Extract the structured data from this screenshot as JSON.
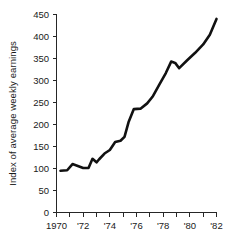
{
  "chart_data": {
    "type": "line",
    "title": "",
    "subtitle": "",
    "xlabel": "",
    "ylabel": "Index of average weekly earnings",
    "xlim": [
      1970,
      1982
    ],
    "ylim": [
      0,
      450
    ],
    "grid": false,
    "legend": null,
    "legend_position": "none",
    "yticks": [
      0,
      50,
      100,
      150,
      200,
      250,
      300,
      350,
      400,
      450
    ],
    "ytick_labels": [
      "0",
      "50",
      "100",
      "150",
      "200",
      "250",
      "300",
      "350",
      "400",
      "450"
    ],
    "xticks": [
      1970,
      1971,
      1972,
      1973,
      1974,
      1975,
      1976,
      1977,
      1978,
      1979,
      1980,
      1981,
      1982
    ],
    "xtick_labels": [
      "1970",
      "",
      "'72",
      "",
      "'74",
      "",
      "'76",
      "",
      "'78",
      "",
      "'80",
      "",
      "'82"
    ],
    "series": [
      {
        "name": "Index of average weekly earnings",
        "color": "#111111",
        "x": [
          1970.3,
          1970.8,
          1971.2,
          1971.5,
          1972.0,
          1972.4,
          1972.7,
          1973.0,
          1973.2,
          1973.6,
          1974.0,
          1974.4,
          1974.8,
          1975.1,
          1975.4,
          1975.8,
          1976.3,
          1976.8,
          1977.2,
          1977.7,
          1978.2,
          1978.6,
          1978.9,
          1979.2,
          1979.8,
          1980.4,
          1981.0,
          1981.5,
          1982.0
        ],
        "values": [
          95,
          96,
          110,
          107,
          101,
          101,
          122,
          114,
          121,
          134,
          142,
          160,
          163,
          172,
          205,
          235,
          236,
          248,
          263,
          290,
          317,
          343,
          340,
          328,
          346,
          363,
          382,
          404,
          440
        ]
      }
    ],
    "annotations": []
  }
}
